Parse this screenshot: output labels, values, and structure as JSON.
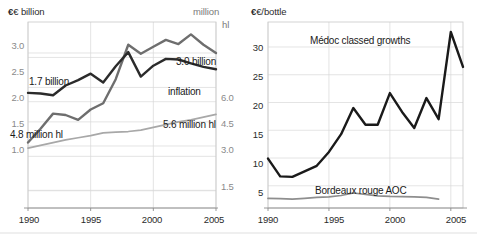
{
  "figure": {
    "width": 477,
    "height": 237,
    "background": "#ffffff",
    "colors": {
      "dark_series": "#2b2b2b",
      "mid_series": "#6e6e6e",
      "light_series": "#a8a8a8",
      "gridline": "#d9d9d9",
      "axis": "#8c8c8c",
      "tick_text": "#8a8a8a",
      "label_text": "#1a1a1a"
    }
  },
  "chart_data": [
    {
      "type": "line",
      "id": "bordeaux-production-value",
      "title": "",
      "xlabel": "",
      "ylabel": "€ billion",
      "ylabel_right": "million hl",
      "xlim": [
        1990,
        2005
      ],
      "ylim": [
        0.75,
        3.45
      ],
      "ylim_right": [
        0.9,
        7.2
      ],
      "xticks": [
        1990,
        1995,
        2000,
        2005
      ],
      "yticks": [
        1.0,
        1.5,
        2.0,
        2.5,
        3.0
      ],
      "yticks_right": [
        1.5,
        3.0,
        4.5,
        6.0
      ],
      "grid": true,
      "legend": "inline-annotations",
      "x": [
        1990,
        1991,
        1992,
        1993,
        1994,
        1995,
        1996,
        1997,
        1998,
        1999,
        2000,
        2001,
        2002,
        2003,
        2004,
        2005
      ],
      "series": [
        {
          "name": "Turnover (€ billion)",
          "axis": "left",
          "color": "#6e6e6e",
          "values": [
            1.7,
            1.9,
            2.12,
            2.1,
            2.03,
            2.18,
            2.27,
            2.62,
            3.12,
            2.99,
            3.09,
            3.19,
            3.13,
            3.27,
            3.12,
            3.0
          ]
        },
        {
          "name": "Volume (million hl)",
          "axis": "right",
          "color": "#2b2b2b",
          "values": [
            4.8,
            4.78,
            4.72,
            5.05,
            5.23,
            5.45,
            5.15,
            5.7,
            6.18,
            5.35,
            5.72,
            5.95,
            5.93,
            5.8,
            5.68,
            5.6
          ]
        },
        {
          "name": "inflation",
          "axis": "left",
          "color": "#a8a8a8",
          "values": [
            1.62,
            1.66,
            1.7,
            1.74,
            1.77,
            1.8,
            1.84,
            1.85,
            1.86,
            1.88,
            1.92,
            1.96,
            2.0,
            2.03,
            2.07,
            2.11
          ]
        }
      ],
      "annotations": [
        {
          "text": "1.7 billion",
          "x": 1991.0,
          "y": 2.37
        },
        {
          "text": "3.0 billion",
          "x": 2001.2,
          "y": 2.72
        },
        {
          "text": "inflation",
          "x": 2000.8,
          "y": 2.15
        },
        {
          "text": "4.8 million hl",
          "x": 1990.3,
          "y": 1.34
        },
        {
          "text": "5.6 million hl",
          "x": 2000.6,
          "y": 1.53
        }
      ]
    },
    {
      "type": "line",
      "id": "bordeaux-bottle-prices",
      "title": "",
      "xlabel": "",
      "ylabel": "€/bottle",
      "xlim": [
        1990,
        2006
      ],
      "ylim": [
        1.0,
        34.5
      ],
      "xticks": [
        1990,
        1995,
        2000,
        2005
      ],
      "yticks": [
        5,
        10,
        15,
        20,
        25,
        30
      ],
      "grid": true,
      "legend": "inline-annotations",
      "x": [
        1990,
        1991,
        1992,
        1993,
        1994,
        1995,
        1996,
        1997,
        1998,
        1999,
        2000,
        2001,
        2002,
        2003,
        2004,
        2005,
        2006
      ],
      "series": [
        {
          "name": "Médoc classed growths",
          "color": "#1a1a1a",
          "values": [
            9.9,
            6.7,
            6.6,
            7.6,
            8.6,
            11.1,
            14.3,
            19.0,
            16.0,
            16.0,
            21.7,
            18.3,
            15.4,
            20.8,
            17.0,
            32.7,
            26.4
          ]
        },
        {
          "name": "Bordeaux rouge AOC",
          "color": "#8e8e8e",
          "values": [
            2.75,
            2.7,
            2.6,
            2.75,
            2.9,
            3.0,
            3.25,
            3.7,
            3.45,
            3.2,
            3.1,
            3.05,
            3.0,
            2.9,
            2.6,
            null,
            null
          ]
        }
      ],
      "annotations": [
        {
          "text": "Médoc classed growths",
          "x": 1994.6,
          "y": 30.6
        },
        {
          "text": "Bordeaux rouge AOC",
          "x": 1995.4,
          "y": 5.2
        }
      ]
    }
  ],
  "left_chart": {
    "axis_title_left": "€ billion",
    "axis_title_right_line1": "million",
    "axis_title_right_line2": "hl",
    "y_ticks_left": [
      "3.0",
      "2.5",
      "2.0",
      "1.5",
      "1.0"
    ],
    "y_ticks_right": [
      "6.0",
      "4.5",
      "3.0",
      "1.5"
    ],
    "x_ticks": [
      "1990",
      "1995",
      "2000",
      "2005"
    ],
    "labels": {
      "turnover_start": "1.7 billion",
      "turnover_end": "3.0 billion",
      "inflation": "inflation",
      "volume_start": "4.8 million hl",
      "volume_end": "5.6 million hl"
    }
  },
  "right_chart": {
    "axis_title": "€/bottle",
    "y_ticks": [
      "30",
      "25",
      "20",
      "15",
      "10",
      "5"
    ],
    "x_ticks": [
      "1990",
      "1995",
      "2000",
      "2005"
    ],
    "labels": {
      "medoc": "Médoc classed growths",
      "bordeaux": "Bordeaux rouge AOC"
    }
  }
}
